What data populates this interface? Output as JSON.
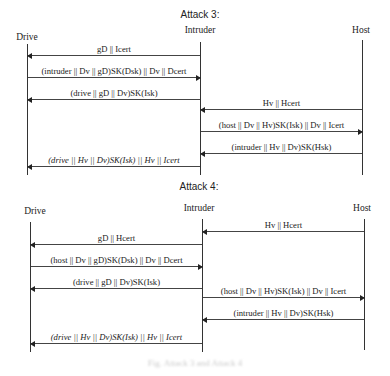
{
  "attack3": {
    "title": "Attack 3:",
    "lanes": {
      "drive": "Drive",
      "intruder": "Intruder",
      "host": "Host"
    },
    "messages": [
      {
        "text": "gD || Icert",
        "from": "intruder",
        "to": "drive"
      },
      {
        "text": "(intruder || Dv || gD)SK(Dsk) || Dv || Dcert",
        "from": "drive",
        "to": "intruder"
      },
      {
        "text": "(drive || gD || Dv)SK(Isk)",
        "from": "intruder",
        "to": "drive"
      },
      {
        "text": "Hv || Hcert",
        "from": "host",
        "to": "intruder"
      },
      {
        "text": "(host || Dv || Hv)SK(Isk) || Dv || Icert",
        "from": "intruder",
        "to": "host"
      },
      {
        "text": "(intruder || Hv || Dv)SK(Hsk)",
        "from": "host",
        "to": "intruder"
      },
      {
        "text": "(drive || Hv || Dv)SK(Isk) || Hv || Icert",
        "from": "intruder",
        "to": "drive",
        "italic": true
      }
    ]
  },
  "attack4": {
    "title": "Attack 4:",
    "lanes": {
      "drive": "Drive",
      "intruder": "Intruder",
      "host": "Host"
    },
    "messages": [
      {
        "text": "Hv || Hcert",
        "from": "host",
        "to": "intruder"
      },
      {
        "text": "gD || Hcert",
        "from": "intruder",
        "to": "drive"
      },
      {
        "text": "(host || Dv || gD)SK(Dsk) || Dv || Dcert",
        "from": "drive",
        "to": "intruder"
      },
      {
        "text": "(drive || gD || Dv)SK(Isk)",
        "from": "intruder",
        "to": "drive"
      },
      {
        "text": "(host || Dv || Hv)SK(Isk) || Dv || Icert",
        "from": "intruder",
        "to": "host"
      },
      {
        "text": "(intruder || Hv || Dv)SK(Hsk)",
        "from": "host",
        "to": "intruder"
      },
      {
        "text": "(drive || Hv || Dv)SK(Isk) || Hv || Icert",
        "from": "intruder",
        "to": "drive",
        "italic": true
      }
    ]
  },
  "caption": "Fig. Attack 3 and Attack 4"
}
